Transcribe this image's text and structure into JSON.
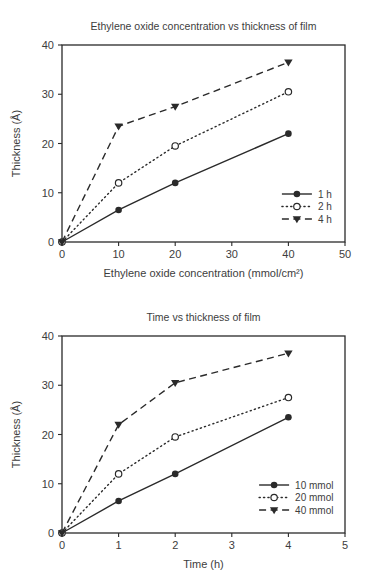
{
  "page": {
    "background": "#ffffff",
    "line_color": "#2a2a2a",
    "text_color": "#3d3d3d"
  },
  "chart_data": [
    {
      "type": "line",
      "title": "Ethylene oxide concentration vs thickness of film",
      "xlabel": "Ethylene oxide concentration (mmol/cm²)",
      "ylabel": "Thickness (Å)",
      "xlim": [
        0,
        50
      ],
      "ylim": [
        0,
        40
      ],
      "xticks": [
        0,
        10,
        20,
        30,
        40,
        50
      ],
      "yticks": [
        0,
        10,
        20,
        30,
        40
      ],
      "grid": false,
      "legend_position": "lower right",
      "x": [
        0,
        10,
        20,
        40
      ],
      "series": [
        {
          "name": "1 h",
          "marker": "circle-filled",
          "line": "solid",
          "values": [
            0,
            6.5,
            12,
            22
          ]
        },
        {
          "name": "2 h",
          "marker": "circle-open",
          "line": "dotted",
          "values": [
            0,
            12,
            19.5,
            30.5
          ]
        },
        {
          "name": "4 h",
          "marker": "triangle-down-filled",
          "line": "dashed",
          "values": [
            0,
            23.5,
            27.5,
            36.5
          ]
        }
      ]
    },
    {
      "type": "line",
      "title": "Time vs thickness of film",
      "xlabel": "Time (h)",
      "ylabel": "Thickness (Å)",
      "xlim": [
        0,
        5
      ],
      "ylim": [
        0,
        40
      ],
      "xticks": [
        0,
        1,
        2,
        3,
        4,
        5
      ],
      "yticks": [
        0,
        10,
        20,
        30,
        40
      ],
      "grid": false,
      "legend_position": "lower right",
      "x": [
        0,
        1,
        2,
        4
      ],
      "series": [
        {
          "name": "10 mmol",
          "marker": "circle-filled",
          "line": "solid",
          "values": [
            0,
            6.5,
            12,
            23.5
          ]
        },
        {
          "name": "20 mmol",
          "marker": "circle-open",
          "line": "dotted",
          "values": [
            0,
            12,
            19.5,
            27.5
          ]
        },
        {
          "name": "40 mmol",
          "marker": "triangle-down-filled",
          "line": "dashed",
          "values": [
            0,
            22,
            30.5,
            36.5
          ]
        }
      ]
    }
  ]
}
